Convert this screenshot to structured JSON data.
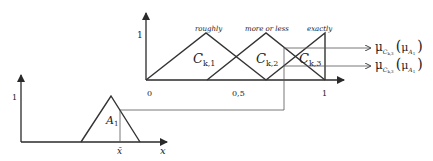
{
  "top_chart": {
    "y_tick": "1",
    "x_ticks": [
      "0",
      "0,5",
      "1"
    ],
    "terms": [
      {
        "label": "roughly",
        "set_main": "C",
        "set_sub": "k,1"
      },
      {
        "label": "more or less",
        "set_main": "C",
        "set_sub": "k,2"
      },
      {
        "label": "exactly",
        "set_main": "C",
        "set_sub": "k,3"
      }
    ]
  },
  "bottom_chart": {
    "y_tick": "1",
    "set_main": "A",
    "set_sub": "1",
    "x_bar": "x̄",
    "x_label": "x"
  },
  "outputs": [
    {
      "mu": "μ",
      "sub_main": "C",
      "sub_sub": "k,3",
      "arg_main": "μ",
      "arg_sub": "A",
      "arg_subsub": "1"
    },
    {
      "mu": "μ",
      "sub_main": "C",
      "sub_sub": "k,3",
      "arg_main": "μ",
      "arg_sub": "A",
      "arg_subsub": "1"
    }
  ]
}
